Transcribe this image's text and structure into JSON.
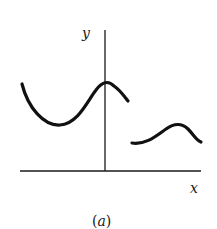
{
  "figure": {
    "caption": "(a)",
    "axes": {
      "x_label": "x",
      "y_label": "y"
    },
    "curves": [
      {
        "name": "left-segment",
        "description": "wave that dips to a minimum left of the y-axis then rises to a local maximum at the y-axis and falls",
        "points": [
          [
            22,
            84
          ],
          [
            58,
            125
          ],
          [
            104,
            84
          ],
          [
            128,
            101
          ]
        ]
      },
      {
        "name": "right-segment",
        "description": "separate wave segment to the right, lower, with a local maximum",
        "points": [
          [
            131,
            143
          ],
          [
            178,
            124
          ],
          [
            201,
            142
          ]
        ]
      }
    ],
    "colors": {
      "stroke": "#111111",
      "background": "#ffffff"
    }
  }
}
